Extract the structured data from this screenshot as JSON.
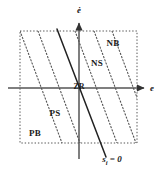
{
  "figure": {
    "type": "phase-plane-diagram",
    "title": "",
    "background_color": "#ffffff",
    "line_color": "#333333",
    "dotted_color": "#555555",
    "text_color": "#1a1a1a"
  },
  "axes": {
    "horizontal": {
      "label": "e",
      "label_x": 150,
      "label_y": 88,
      "y": 88,
      "x_start": 8,
      "x_end": 146,
      "arrow": "right"
    },
    "vertical": {
      "label": "ė",
      "label_x": 79,
      "label_y": 9,
      "x": 79,
      "y_start": 159,
      "y_end": 21,
      "arrow": "up"
    },
    "origin": {
      "label": "ZR",
      "x": 79,
      "y": 88
    }
  },
  "boundary_box": {
    "x": 20,
    "y": 31,
    "width": 117,
    "height": 112,
    "style": "dotted"
  },
  "sliding_surface": {
    "label": "s",
    "label_subscript": "i",
    "label_equals": " = 0",
    "label_x": 110,
    "label_y": 161,
    "style": "solid",
    "x1": 57,
    "y1": 29,
    "x2": 106,
    "y2": 157
  },
  "regions": [
    {
      "name": "NB",
      "label": "NB",
      "x": 113,
      "y": 43
    },
    {
      "name": "NS",
      "label": "NS",
      "x": 97,
      "y": 63
    },
    {
      "name": "ZR",
      "label": "ZR",
      "x": 79,
      "y": 88
    },
    {
      "name": "PS",
      "label": "PS",
      "x": 55,
      "y": 113
    },
    {
      "name": "PB",
      "label": "PB",
      "x": 35,
      "y": 133
    }
  ],
  "boundary_lines": [
    {
      "name": "boundary-1",
      "x_top": 20,
      "x_bottom": 62
    },
    {
      "name": "boundary-2",
      "x_top": 38,
      "x_bottom": 81
    },
    {
      "name": "boundary-3",
      "x_top": 75,
      "x_bottom": 118
    },
    {
      "name": "boundary-4",
      "x_top": 94,
      "x_bottom": 137
    },
    {
      "name": "boundary-5",
      "x_top": 112,
      "x_bottom": 155
    }
  ]
}
